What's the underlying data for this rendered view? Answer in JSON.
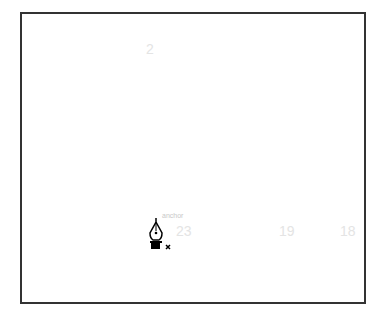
{
  "canvas": {
    "numbers": [
      {
        "text": "2",
        "x": 146,
        "y": 41
      },
      {
        "text": "23",
        "x": 176,
        "y": 223
      },
      {
        "text": "19",
        "x": 279,
        "y": 223
      },
      {
        "text": "18",
        "x": 340,
        "y": 223
      }
    ],
    "cursor_label": "anchor",
    "cursor": {
      "tool": "pen-tool",
      "modifier": "x"
    }
  },
  "colors": {
    "border": "#333333",
    "faint_text": "#e4e4e4"
  }
}
